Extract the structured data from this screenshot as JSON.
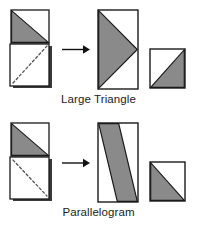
{
  "document": {
    "title": "Paper folding shapes: Large Triangle and Parallelogram",
    "background_color": "#ffffff"
  },
  "style": {
    "shaded_fill": "#8a8a8a",
    "unshaded_fill": "#ffffff",
    "outline_color": "#1a1a1a",
    "shadow_color": "#3a3a3a",
    "dashed_line_color": "#555555",
    "arrow_color": "#111111",
    "caption_color": "#1c1c1c"
  },
  "rows": [
    {
      "id": "large-triangle",
      "caption": "Large Triangle",
      "folded": {
        "name": "folded-paper-large-triangle",
        "upper_panel": {
          "shading": "lower-left-triangle-shaded",
          "fill": "#8a8a8a"
        },
        "lower_panel": {
          "shading": "unshaded",
          "fill": "#ffffff",
          "dashed_diagonal": "bottom-left-to-top-right"
        }
      },
      "arrow": {
        "name": "transformation-arrow",
        "direction": "right",
        "glyph": "→"
      },
      "result_large": {
        "name": "unfolded-large-triangle",
        "shape": "triangle",
        "description": "Large shaded triangle pointing right inside a tall rectangle",
        "fill": "#8a8a8a"
      },
      "result_small": {
        "name": "unfolded-small-square",
        "shape": "square-with-triangle",
        "description": "Square with shaded lower-right triangle",
        "fill": "#8a8a8a"
      }
    },
    {
      "id": "parallelogram",
      "caption": "Parallelogram",
      "folded": {
        "name": "folded-paper-parallelogram",
        "upper_panel": {
          "shading": "lower-left-triangle-shaded",
          "fill": "#8a8a8a"
        },
        "lower_panel": {
          "shading": "unshaded",
          "fill": "#ffffff",
          "dashed_diagonal": "top-left-to-bottom-right"
        }
      },
      "arrow": {
        "name": "transformation-arrow",
        "direction": "right",
        "glyph": "→"
      },
      "result_large": {
        "name": "unfolded-parallelogram",
        "shape": "parallelogram",
        "description": "Shaded diagonal band across a tall rectangle",
        "fill": "#8a8a8a"
      },
      "result_small": {
        "name": "unfolded-small-square",
        "shape": "square-with-triangle",
        "description": "Square with shaded lower-left triangle",
        "fill": "#8a8a8a"
      }
    }
  ]
}
